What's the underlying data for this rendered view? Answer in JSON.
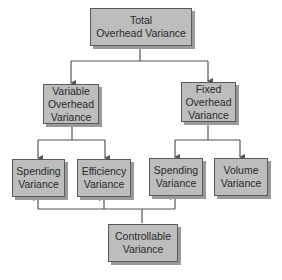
{
  "diagram": {
    "type": "hierarchy-tree",
    "root": {
      "label_lines": [
        "Total",
        "Overhead Variance"
      ]
    },
    "level2": [
      {
        "label_lines": [
          "Variable",
          "Overhead",
          "Variance"
        ]
      },
      {
        "label_lines": [
          "Fixed",
          "Overhead",
          "Variance"
        ]
      }
    ],
    "level3": [
      {
        "label_lines": [
          "Spending",
          "Variance"
        ],
        "parent": "Variable Overhead Variance"
      },
      {
        "label_lines": [
          "Efficiency",
          "Variance"
        ],
        "parent": "Variable Overhead Variance"
      },
      {
        "label_lines": [
          "Spending",
          "Variance"
        ],
        "parent": "Fixed Overhead Variance"
      },
      {
        "label_lines": [
          "Volume",
          "Variance"
        ],
        "parent": "Fixed Overhead Variance"
      }
    ],
    "controllable": {
      "label_lines": [
        "Controllable",
        "Variance"
      ],
      "points_to": [
        "Spending Variance (Variable)",
        "Efficiency Variance",
        "Spending Variance (Fixed)"
      ]
    },
    "colors": {
      "box_fill": "#bdbdbd",
      "box_border": "#5a5a5a",
      "shadow": "#9a9a9a",
      "line": "#555555",
      "background": "#ffffff"
    }
  }
}
